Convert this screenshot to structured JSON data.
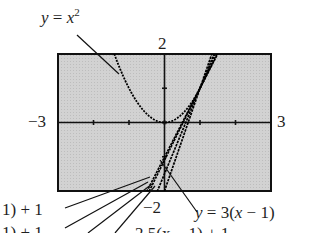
{
  "chart_data": {
    "type": "line",
    "title": "",
    "xlabel": "",
    "ylabel": "",
    "xlim": [
      -3,
      3
    ],
    "ylim": [
      -2,
      2
    ],
    "grid": false,
    "background": "#d4d4d4",
    "tick_labels": {
      "x_min": "−3",
      "x_max": "3",
      "y_max": "2",
      "y_min": "−2"
    },
    "series": [
      {
        "name": "y = x^2",
        "type": "curve",
        "expr": "x^2"
      },
      {
        "name": "y = 3(x − 1) + 1",
        "type": "line",
        "slope": 3,
        "point": [
          1,
          1
        ]
      },
      {
        "name": "y = 2.5(x − 1) + 1",
        "type": "line",
        "slope": 2.5,
        "point": [
          1,
          1
        ]
      },
      {
        "name": "y = 2.1(x − 1) + 1",
        "type": "line",
        "slope": 2.1,
        "point": [
          1,
          1
        ]
      },
      {
        "name": "y = 2.01(x − 1) + 1",
        "type": "line",
        "slope": 2.01,
        "point": [
          1,
          1
        ]
      }
    ],
    "annotations": [
      {
        "text": "y = x²",
        "target": "parabola"
      },
      {
        "text": "y = 3(x − 1)",
        "target": "slope-3 line"
      },
      {
        "text": "1) + 1",
        "target": "secant line (clipped label)"
      },
      {
        "text": "1) + 1",
        "target": "secant line (clipped label)"
      },
      {
        "text": "2.5(x − 1) + 1",
        "target": "slope-2.5 line (clipped label)"
      }
    ]
  },
  "labels": {
    "parabola_y": "y",
    "parabola_eq": " = ",
    "parabola_x": "x",
    "parabola_exp": "2",
    "y_max": "2",
    "y_min": "−2",
    "x_min": "−3",
    "x_max": "3",
    "line3_y": "y",
    "line3_rest": " = 3(",
    "line3_x": "x",
    "line3_end": " − 1)",
    "left1": "1) + 1",
    "left2": "1) + 1",
    "bottom_partial": "2.5(x − 1) + 1"
  }
}
